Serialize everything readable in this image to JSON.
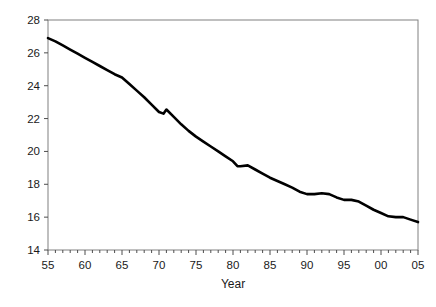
{
  "chart_data": {
    "type": "line",
    "title": "",
    "xlabel": "Year",
    "ylabel": "",
    "xlim": [
      55,
      105
    ],
    "ylim": [
      14,
      28
    ],
    "ytick_step": 2,
    "xtick_step": 5,
    "minor_xtick_step": 1,
    "grid": false,
    "legend": "none",
    "line_color": "#000000",
    "frame_color": "#808080",
    "ytick_labels": [
      "14",
      "16",
      "18",
      "20",
      "22",
      "24",
      "26",
      "28"
    ],
    "ytick_values": [
      14,
      16,
      18,
      20,
      22,
      24,
      26,
      28
    ],
    "xtick_labels": [
      "55",
      "60",
      "65",
      "70",
      "75",
      "80",
      "85",
      "90",
      "95",
      "00",
      "05"
    ],
    "xtick_values": [
      55,
      60,
      65,
      70,
      75,
      80,
      85,
      90,
      95,
      100,
      105
    ],
    "x": [
      55,
      56,
      57,
      58,
      59,
      60,
      61,
      62,
      63,
      64,
      65,
      66,
      67,
      68,
      69,
      70,
      70.6,
      71,
      72,
      73,
      74,
      75,
      76,
      77,
      78,
      79,
      80,
      80.6,
      81,
      82,
      83,
      84,
      85,
      86,
      87,
      88,
      89,
      90,
      91,
      92,
      93,
      94,
      95,
      96,
      97,
      98,
      99,
      100,
      101,
      102,
      103,
      104,
      105
    ],
    "values": [
      26.9,
      26.7,
      26.45,
      26.2,
      25.95,
      25.7,
      25.45,
      25.2,
      24.95,
      24.7,
      24.5,
      24.1,
      23.7,
      23.3,
      22.85,
      22.4,
      22.3,
      22.55,
      22.1,
      21.65,
      21.25,
      20.9,
      20.6,
      20.3,
      20.0,
      19.7,
      19.4,
      19.1,
      19.1,
      19.15,
      18.9,
      18.65,
      18.4,
      18.2,
      18.0,
      17.8,
      17.55,
      17.4,
      17.4,
      17.45,
      17.4,
      17.2,
      17.05,
      17.05,
      16.95,
      16.7,
      16.45,
      16.25,
      16.05,
      16.0,
      16.0,
      15.85,
      15.7
    ]
  },
  "axis": {
    "x_title": "Year"
  }
}
